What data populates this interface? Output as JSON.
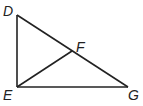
{
  "diagram": {
    "type": "geometry-figure",
    "points": [
      {
        "id": "D",
        "label": "D",
        "x": 17,
        "y": 15,
        "lx": 3,
        "ly": 16
      },
      {
        "id": "E",
        "label": "E",
        "x": 17,
        "y": 87,
        "lx": 3,
        "ly": 100
      },
      {
        "id": "G",
        "label": "G",
        "x": 128,
        "y": 87,
        "lx": 128,
        "ly": 100
      },
      {
        "id": "F",
        "label": "F",
        "x": 72,
        "y": 51,
        "lx": 76,
        "ly": 52
      }
    ],
    "segments": [
      {
        "from": "D",
        "to": "E"
      },
      {
        "from": "E",
        "to": "G"
      },
      {
        "from": "D",
        "to": "G"
      },
      {
        "from": "E",
        "to": "F"
      }
    ]
  }
}
